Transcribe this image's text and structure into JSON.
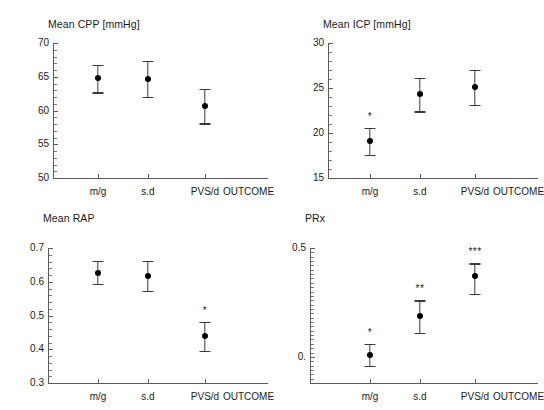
{
  "figure": {
    "x_axis_name": "OUTCOME",
    "group_labels": [
      "m/g",
      "s.d",
      "PVS/d"
    ]
  },
  "chart_data": [
    {
      "type": "scatter",
      "panel": "top-left",
      "title": "Mean CPP [mmHg]",
      "xlabel": "OUTCOME",
      "ylabel": "",
      "categories": [
        "m/g",
        "s.d",
        "PVS/d"
      ],
      "values": [
        64.8,
        64.7,
        60.7
      ],
      "err_low": [
        62.7,
        62.0,
        58.1
      ],
      "err_high": [
        66.8,
        67.4,
        63.2
      ],
      "significance": [
        "",
        "",
        ""
      ],
      "ylim": [
        50,
        70
      ],
      "yticks": [
        50,
        55,
        60,
        65,
        70
      ],
      "ytick_labels": [
        "50",
        "55",
        "60",
        "65",
        "70"
      ],
      "grid": false,
      "legend": "none"
    },
    {
      "type": "scatter",
      "panel": "top-right",
      "title": "Mean ICP [mmHg]",
      "xlabel": "OUTCOME",
      "ylabel": "",
      "categories": [
        "m/g",
        "s.d",
        "PVS/d"
      ],
      "values": [
        19.1,
        24.3,
        25.1
      ],
      "err_low": [
        17.6,
        22.4,
        23.1
      ],
      "err_high": [
        20.6,
        26.1,
        27.0
      ],
      "significance": [
        "*",
        "",
        ""
      ],
      "ylim": [
        15,
        30
      ],
      "yticks": [
        15,
        20,
        25,
        30
      ],
      "ytick_labels": [
        "15",
        "20",
        "25",
        "30"
      ],
      "grid": false,
      "legend": "none"
    },
    {
      "type": "scatter",
      "panel": "bottom-left",
      "title": "Mean RAP",
      "xlabel": "OUTCOME",
      "ylabel": "",
      "categories": [
        "m/g",
        "s.d",
        "PVS/d"
      ],
      "values": [
        0.627,
        0.617,
        0.44
      ],
      "err_low": [
        0.594,
        0.574,
        0.396
      ],
      "err_high": [
        0.662,
        0.662,
        0.482
      ],
      "significance": [
        "",
        "",
        "*"
      ],
      "ylim": [
        0.3,
        0.7
      ],
      "yticks": [
        0.3,
        0.4,
        0.5,
        0.6,
        0.7
      ],
      "ytick_labels": [
        "0.3",
        "0.4",
        "0.5",
        "0.6",
        "0.7"
      ],
      "grid": false,
      "legend": "none"
    },
    {
      "type": "scatter",
      "panel": "bottom-right",
      "title": "PRx",
      "xlabel": "OUTCOME",
      "ylabel": "",
      "categories": [
        "m/g",
        "s.d",
        "PVS/d"
      ],
      "values": [
        0.01,
        0.19,
        0.37
      ],
      "err_low": [
        -0.04,
        0.11,
        0.29
      ],
      "err_high": [
        0.06,
        0.26,
        0.43
      ],
      "significance": [
        "*",
        "**",
        "***"
      ],
      "ylim": [
        -0.12,
        0.5
      ],
      "yticks": [
        0.0,
        0.5
      ],
      "ytick_labels": [
        "0.",
        "0.5"
      ],
      "grid": false,
      "legend": "none"
    }
  ]
}
